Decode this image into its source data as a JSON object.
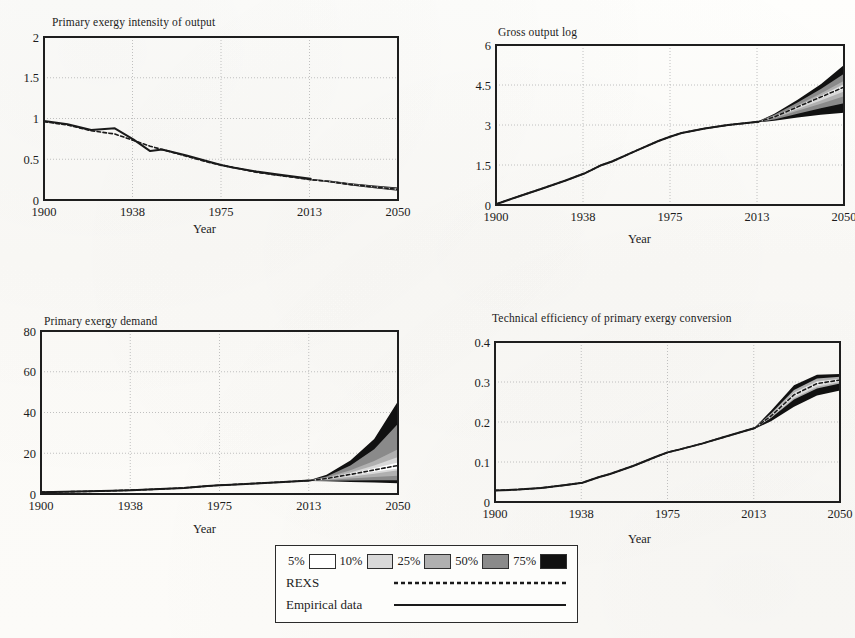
{
  "figure": {
    "shared_xlabel": "Year",
    "shared_xticks": [
      "1900",
      "1938",
      "1975",
      "2013",
      "2050"
    ],
    "xlim": [
      1900,
      2050
    ]
  },
  "legend": {
    "bands": [
      {
        "label": "5%",
        "swatch": "#ffffff"
      },
      {
        "label": "10%",
        "swatch": "#d9d9d9"
      },
      {
        "label": "25%",
        "swatch": "#b0b0b0"
      },
      {
        "label": "50%",
        "swatch": "#8a8a8a"
      },
      {
        "label": "75%",
        "swatch": "#111111"
      }
    ],
    "series": [
      {
        "label": "REXS",
        "style": "dashed"
      },
      {
        "label": "Empirical data",
        "style": "solid"
      }
    ]
  },
  "chart_data": [
    {
      "id": "primary-exergy-intensity",
      "type": "area",
      "title": "Primary exergy intensity of output",
      "xlabel": "Year",
      "ylabel": "",
      "xlim": [
        1900,
        2050
      ],
      "ylim": [
        0,
        2
      ],
      "xticks": [
        "1900",
        "1938",
        "1975",
        "2013",
        "2050"
      ],
      "yticks": [
        "0",
        "0.5",
        "1",
        "1.5",
        "2"
      ],
      "grid": true,
      "legend_position": "external-bottom",
      "x": [
        1900,
        1910,
        1920,
        1930,
        1938,
        1945,
        1950,
        1960,
        1970,
        1975,
        1980,
        1990,
        2000,
        2013,
        2020,
        2030,
        2040,
        2050
      ],
      "series": [
        {
          "name": "Empirical data",
          "style": "solid",
          "values": [
            0.97,
            0.93,
            0.86,
            0.88,
            0.74,
            0.6,
            0.62,
            0.55,
            0.47,
            0.43,
            0.4,
            0.35,
            0.31,
            0.26,
            null,
            null,
            null,
            null
          ]
        },
        {
          "name": "REXS",
          "style": "dashed",
          "values": [
            0.96,
            0.92,
            0.85,
            0.81,
            0.73,
            0.66,
            0.62,
            0.54,
            0.46,
            0.43,
            0.4,
            0.34,
            0.3,
            0.25,
            0.23,
            0.19,
            0.16,
            0.13
          ]
        }
      ],
      "bands": [
        {
          "label": "75%",
          "lower": [
            0.96,
            0.92,
            0.85,
            0.81,
            0.73,
            0.66,
            0.62,
            0.54,
            0.46,
            0.43,
            0.395,
            0.335,
            0.295,
            0.243,
            0.22,
            0.178,
            0.145,
            0.112
          ],
          "upper": [
            0.96,
            0.92,
            0.85,
            0.81,
            0.73,
            0.66,
            0.62,
            0.54,
            0.46,
            0.43,
            0.405,
            0.345,
            0.308,
            0.258,
            0.243,
            0.205,
            0.178,
            0.152
          ]
        },
        {
          "label": "50%",
          "lower": [
            0.96,
            0.92,
            0.85,
            0.81,
            0.73,
            0.66,
            0.62,
            0.54,
            0.46,
            0.43,
            0.397,
            0.337,
            0.298,
            0.246,
            0.224,
            0.183,
            0.151,
            0.119
          ],
          "upper": [
            0.96,
            0.92,
            0.85,
            0.81,
            0.73,
            0.66,
            0.62,
            0.54,
            0.46,
            0.43,
            0.403,
            0.343,
            0.305,
            0.255,
            0.239,
            0.2,
            0.171,
            0.144
          ]
        },
        {
          "label": "25%",
          "lower": [
            0.96,
            0.92,
            0.85,
            0.81,
            0.73,
            0.66,
            0.62,
            0.54,
            0.46,
            0.43,
            0.398,
            0.339,
            0.3,
            0.248,
            0.227,
            0.187,
            0.156,
            0.125
          ],
          "upper": [
            0.96,
            0.92,
            0.85,
            0.81,
            0.73,
            0.66,
            0.62,
            0.54,
            0.46,
            0.43,
            0.402,
            0.341,
            0.303,
            0.252,
            0.235,
            0.195,
            0.165,
            0.137
          ]
        },
        {
          "label": "10%",
          "lower": [
            0.96,
            0.92,
            0.85,
            0.81,
            0.73,
            0.66,
            0.62,
            0.54,
            0.46,
            0.43,
            0.399,
            0.34,
            0.301,
            0.249,
            0.229,
            0.19,
            0.159,
            0.129
          ],
          "upper": [
            0.96,
            0.92,
            0.85,
            0.81,
            0.73,
            0.66,
            0.62,
            0.54,
            0.46,
            0.43,
            0.401,
            0.341,
            0.302,
            0.251,
            0.232,
            0.192,
            0.162,
            0.133
          ]
        }
      ]
    },
    {
      "id": "gross-output-log",
      "type": "area",
      "title": "Gross output log",
      "xlabel": "Year",
      "ylabel": "",
      "xlim": [
        1900,
        2050
      ],
      "ylim": [
        0,
        6
      ],
      "xticks": [
        "1900",
        "1938",
        "1975",
        "2013",
        "2050"
      ],
      "yticks": [
        "0",
        "1.5",
        "3",
        "4.5",
        "6"
      ],
      "grid": true,
      "legend_position": "external-bottom",
      "x": [
        1900,
        1910,
        1920,
        1930,
        1938,
        1945,
        1950,
        1960,
        1970,
        1975,
        1980,
        1990,
        2000,
        2013,
        2020,
        2030,
        2040,
        2050
      ],
      "series": [
        {
          "name": "Empirical data",
          "style": "solid",
          "values": [
            0.03,
            0.33,
            0.62,
            0.92,
            1.18,
            1.48,
            1.63,
            2.02,
            2.4,
            2.56,
            2.7,
            2.87,
            3.0,
            3.12,
            null,
            null,
            null,
            null
          ]
        },
        {
          "name": "REXS",
          "style": "dashed",
          "values": [
            0.03,
            0.33,
            0.62,
            0.92,
            1.18,
            1.48,
            1.63,
            2.02,
            2.4,
            2.56,
            2.7,
            2.87,
            3.0,
            3.12,
            3.3,
            3.68,
            4.05,
            4.42
          ]
        }
      ],
      "bands": [
        {
          "label": "75%",
          "lower": [
            0.03,
            0.33,
            0.62,
            0.92,
            1.18,
            1.48,
            1.63,
            2.02,
            2.4,
            2.56,
            2.7,
            2.87,
            3.0,
            3.1,
            3.16,
            3.28,
            3.38,
            3.46
          ],
          "upper": [
            0.03,
            0.33,
            0.62,
            0.92,
            1.18,
            1.48,
            1.63,
            2.02,
            2.4,
            2.56,
            2.7,
            2.87,
            3.0,
            3.14,
            3.42,
            3.95,
            4.53,
            5.25
          ]
        },
        {
          "label": "50%",
          "lower": [
            0.03,
            0.33,
            0.62,
            0.92,
            1.18,
            1.48,
            1.63,
            2.02,
            2.4,
            2.56,
            2.7,
            2.87,
            3.0,
            3.105,
            3.21,
            3.42,
            3.63,
            3.82
          ],
          "upper": [
            0.03,
            0.33,
            0.62,
            0.92,
            1.18,
            1.48,
            1.63,
            2.02,
            2.4,
            2.56,
            2.7,
            2.87,
            3.0,
            3.135,
            3.38,
            3.84,
            4.35,
            4.92
          ]
        },
        {
          "label": "25%",
          "lower": [
            0.03,
            0.33,
            0.62,
            0.92,
            1.18,
            1.48,
            1.63,
            2.02,
            2.4,
            2.56,
            2.7,
            2.87,
            3.0,
            3.11,
            3.25,
            3.53,
            3.8,
            4.08
          ],
          "upper": [
            0.03,
            0.33,
            0.62,
            0.92,
            1.18,
            1.48,
            1.63,
            2.02,
            2.4,
            2.56,
            2.7,
            2.87,
            3.0,
            3.13,
            3.34,
            3.74,
            4.18,
            4.66
          ]
        },
        {
          "label": "10%",
          "lower": [
            0.03,
            0.33,
            0.62,
            0.92,
            1.18,
            1.48,
            1.63,
            2.02,
            2.4,
            2.56,
            2.7,
            2.87,
            3.0,
            3.115,
            3.28,
            3.6,
            3.92,
            4.26
          ],
          "upper": [
            0.03,
            0.33,
            0.62,
            0.92,
            1.18,
            1.48,
            1.63,
            2.02,
            2.4,
            2.56,
            2.7,
            2.87,
            3.0,
            3.125,
            3.32,
            3.7,
            4.1,
            4.54
          ]
        }
      ]
    },
    {
      "id": "primary-exergy-demand",
      "type": "area",
      "title": "Primary exergy demand",
      "xlabel": "Year",
      "ylabel": "",
      "xlim": [
        1900,
        2050
      ],
      "ylim": [
        0,
        80
      ],
      "xticks": [
        "1900",
        "1938",
        "1975",
        "2013",
        "2050"
      ],
      "yticks": [
        "0",
        "20",
        "40",
        "60",
        "80"
      ],
      "grid": true,
      "legend_position": "external-bottom",
      "x": [
        1900,
        1910,
        1920,
        1930,
        1938,
        1945,
        1950,
        1960,
        1970,
        1975,
        1980,
        1990,
        2000,
        2013,
        2020,
        2030,
        2040,
        2050
      ],
      "series": [
        {
          "name": "Empirical data",
          "style": "solid",
          "values": [
            0.9,
            1.1,
            1.3,
            1.6,
            1.9,
            2.2,
            2.4,
            3.0,
            3.9,
            4.3,
            4.6,
            5.2,
            5.8,
            6.6,
            null,
            null,
            null,
            null
          ]
        },
        {
          "name": "REXS",
          "style": "dashed",
          "values": [
            0.9,
            1.1,
            1.3,
            1.6,
            1.9,
            2.2,
            2.4,
            3.0,
            3.9,
            4.3,
            4.6,
            5.2,
            5.8,
            6.6,
            7.6,
            9.6,
            11.8,
            14.0
          ]
        }
      ],
      "bands": [
        {
          "label": "75%",
          "lower": [
            0.9,
            1.1,
            1.3,
            1.6,
            1.9,
            2.2,
            2.4,
            3.0,
            3.9,
            4.3,
            4.6,
            5.2,
            5.8,
            6.4,
            6.2,
            5.9,
            5.6,
            5.3
          ],
          "upper": [
            0.9,
            1.1,
            1.3,
            1.6,
            1.9,
            2.2,
            2.4,
            3.0,
            3.9,
            4.3,
            4.6,
            5.2,
            5.8,
            6.9,
            9.4,
            16.5,
            27.0,
            45.5
          ]
        },
        {
          "label": "50%",
          "lower": [
            0.9,
            1.1,
            1.3,
            1.6,
            1.9,
            2.2,
            2.4,
            3.0,
            3.9,
            4.3,
            4.6,
            5.2,
            5.8,
            6.45,
            6.5,
            6.6,
            6.7,
            6.8
          ],
          "upper": [
            0.9,
            1.1,
            1.3,
            1.6,
            1.9,
            2.2,
            2.4,
            3.0,
            3.9,
            4.3,
            4.6,
            5.2,
            5.8,
            6.82,
            8.6,
            14.0,
            22.0,
            34.5
          ]
        },
        {
          "label": "25%",
          "lower": [
            0.9,
            1.1,
            1.3,
            1.6,
            1.9,
            2.2,
            2.4,
            3.0,
            3.9,
            4.3,
            4.6,
            5.2,
            5.8,
            6.5,
            6.9,
            7.6,
            8.3,
            9.0
          ],
          "upper": [
            0.9,
            1.1,
            1.3,
            1.6,
            1.9,
            2.2,
            2.4,
            3.0,
            3.9,
            4.3,
            4.6,
            5.2,
            5.8,
            6.75,
            8.1,
            11.6,
            16.2,
            22.0
          ]
        },
        {
          "label": "10%",
          "lower": [
            0.9,
            1.1,
            1.3,
            1.6,
            1.9,
            2.2,
            2.4,
            3.0,
            3.9,
            4.3,
            4.6,
            5.2,
            5.8,
            6.55,
            7.2,
            8.5,
            10.0,
            11.6
          ],
          "upper": [
            0.9,
            1.1,
            1.3,
            1.6,
            1.9,
            2.2,
            2.4,
            3.0,
            3.9,
            4.3,
            4.6,
            5.2,
            5.8,
            6.7,
            7.9,
            10.6,
            14.0,
            18.2
          ]
        }
      ]
    },
    {
      "id": "technical-efficiency",
      "type": "area",
      "title": "Technical efficiency of primary exergy conversion",
      "xlabel": "Year",
      "ylabel": "",
      "xlim": [
        1900,
        2050
      ],
      "ylim": [
        0,
        0.4
      ],
      "xticks": [
        "1900",
        "1938",
        "1975",
        "2013",
        "2050"
      ],
      "yticks": [
        "0",
        "0.1",
        "0.2",
        "0.3",
        "0.4"
      ],
      "grid": true,
      "legend_position": "external-bottom",
      "x": [
        1900,
        1910,
        1920,
        1930,
        1938,
        1945,
        1950,
        1960,
        1970,
        1975,
        1980,
        1990,
        2000,
        2013,
        2020,
        2030,
        2040,
        2050
      ],
      "series": [
        {
          "name": "Empirical data",
          "style": "solid",
          "values": [
            0.029,
            0.031,
            0.035,
            0.042,
            0.048,
            0.062,
            0.07,
            0.09,
            0.113,
            0.124,
            0.131,
            0.146,
            0.163,
            0.185,
            null,
            null,
            null,
            null
          ]
        },
        {
          "name": "REXS",
          "style": "dashed",
          "values": [
            0.029,
            0.031,
            0.035,
            0.042,
            0.048,
            0.062,
            0.07,
            0.09,
            0.113,
            0.124,
            0.131,
            0.146,
            0.163,
            0.185,
            0.215,
            0.268,
            0.296,
            0.305
          ]
        }
      ],
      "bands": [
        {
          "label": "75%",
          "lower": [
            0.029,
            0.031,
            0.035,
            0.042,
            0.048,
            0.062,
            0.07,
            0.09,
            0.113,
            0.124,
            0.131,
            0.146,
            0.163,
            0.183,
            0.202,
            0.238,
            0.266,
            0.279
          ],
          "upper": [
            0.029,
            0.031,
            0.035,
            0.042,
            0.048,
            0.062,
            0.07,
            0.09,
            0.113,
            0.124,
            0.131,
            0.146,
            0.163,
            0.187,
            0.228,
            0.292,
            0.318,
            0.32
          ]
        },
        {
          "label": "50%",
          "lower": [
            0.029,
            0.031,
            0.035,
            0.042,
            0.048,
            0.062,
            0.07,
            0.09,
            0.113,
            0.124,
            0.131,
            0.146,
            0.163,
            0.1835,
            0.206,
            0.248,
            0.276,
            0.288
          ]
        },
        {
          "label": "25%",
          "lower": [
            0.029,
            0.031,
            0.035,
            0.042,
            0.048,
            0.062,
            0.07,
            0.09,
            0.113,
            0.124,
            0.131,
            0.146,
            0.163,
            0.184,
            0.21,
            0.256,
            0.284,
            0.296
          ],
          "upper": [
            0.029,
            0.031,
            0.035,
            0.042,
            0.048,
            0.062,
            0.07,
            0.09,
            0.113,
            0.124,
            0.131,
            0.146,
            0.163,
            0.186,
            0.221,
            0.28,
            0.309,
            0.313
          ]
        },
        {
          "label": "10%",
          "lower": [
            0.029,
            0.031,
            0.035,
            0.042,
            0.048,
            0.062,
            0.07,
            0.09,
            0.113,
            0.124,
            0.131,
            0.146,
            0.163,
            0.1845,
            0.212,
            0.26,
            0.288,
            0.3
          ],
          "upper": [
            0.029,
            0.031,
            0.035,
            0.042,
            0.048,
            0.062,
            0.07,
            0.09,
            0.113,
            0.124,
            0.131,
            0.146,
            0.163,
            0.1855,
            0.218,
            0.274,
            0.302,
            0.308
          ]
        }
      ]
    }
  ]
}
